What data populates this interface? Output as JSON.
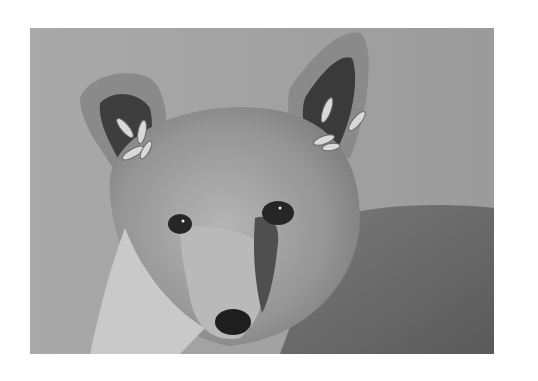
{
  "image": {
    "alt": "Grayscale photograph of a young fox face with larvae (botfly-like) clustered inside its ears",
    "subject": "fox",
    "style": "grayscale",
    "colors": {
      "page_background": "#ffffff",
      "photo_background": "#a3a3a3",
      "fur_light": "#c8c8c8",
      "fur_mid": "#8e8e8e",
      "fur_dark": "#4a4a4a",
      "nose": "#1e1e1e",
      "eye": "#262626",
      "larvae": "#d9d9d9"
    }
  }
}
